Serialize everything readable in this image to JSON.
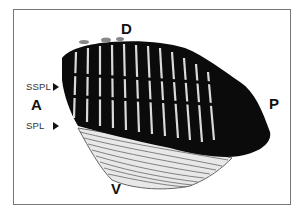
{
  "figure": {
    "orientation_labels": {
      "dorsal": "D",
      "anterior": "A",
      "posterior": "P",
      "ventral": "V"
    },
    "annotations": [
      {
        "label": "SSPL",
        "marker": "arrowhead-right"
      },
      {
        "label": "SPL",
        "marker": "arrowhead-right"
      }
    ]
  }
}
